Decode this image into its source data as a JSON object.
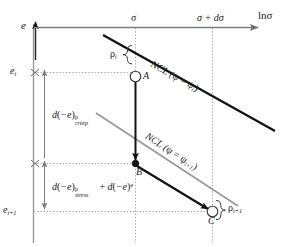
{
  "figure": {
    "type": "diagram",
    "axes": {
      "y_label": "e",
      "x_label": "lnσ",
      "x_tick_1": "σ",
      "x_tick_2": "σ + dσ",
      "y_tick_1": "e",
      "y_tick_1_sub": "i",
      "y_tick_2": "e",
      "y_tick_2_sub": "i+1"
    },
    "lines": [
      {
        "name": "ncl-upper",
        "label_prefix": "NCL (",
        "label_psi": "ψ",
        "label_eq": " = ",
        "label_psi2": "ψ",
        "label_sub": "i",
        "label_suffix": ")",
        "color": "#111111"
      },
      {
        "name": "ncl-lower",
        "label_prefix": "NCL (",
        "label_psi": "ψ",
        "label_eq": " = ",
        "label_psi2": "ψ",
        "label_sub": "i+1",
        "label_suffix": ")",
        "color": "#9a9a9a"
      }
    ],
    "points": [
      {
        "name": "point-a",
        "label": "A"
      },
      {
        "name": "point-b",
        "label": "B"
      },
      {
        "name": "point-c",
        "label": "C"
      }
    ],
    "braces": [
      {
        "name": "rho-i",
        "symbol": "ρ",
        "sub": "i"
      },
      {
        "name": "rho-i-plus-1",
        "symbol": "ρ",
        "sub": "i+1"
      }
    ],
    "measures": [
      {
        "name": "creep-strain",
        "d": "d",
        "open": "(",
        "minus_e": "−e",
        "close": ")",
        "sup": "p",
        "sub": "creep"
      },
      {
        "name": "stress-plus-elastic-strain",
        "d": "d",
        "open": "(",
        "minus_e": "−e",
        "close": ")",
        "sup": "p",
        "sub": "stress",
        "plus": " + ",
        "d2": "d",
        "open2": "(",
        "minus_e2": "−e",
        "close2": ")",
        "sup2": "e"
      }
    ],
    "colors": {
      "axis": "#7d7d7d",
      "ncl_upper": "#111111",
      "ncl_lower": "#9a9a9a",
      "arrow": "#111111",
      "dotted": "#aaaaaa",
      "text": "#1a1a1a"
    }
  }
}
